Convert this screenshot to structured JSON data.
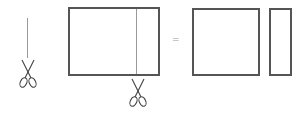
{
  "diagram": {
    "operator": "=",
    "colors": {
      "outline": "#555555",
      "cut_line": "#9a9a9a",
      "scissors": "#444444",
      "background": "#ffffff"
    },
    "elements": [
      {
        "id": "cut-guide",
        "type": "vertical-line-with-scissors"
      },
      {
        "id": "original-rectangle",
        "type": "rectangle-with-cut-line"
      },
      {
        "id": "equals-sign",
        "type": "operator"
      },
      {
        "id": "result-square",
        "type": "square"
      },
      {
        "id": "result-strip",
        "type": "narrow-rectangle"
      }
    ]
  }
}
